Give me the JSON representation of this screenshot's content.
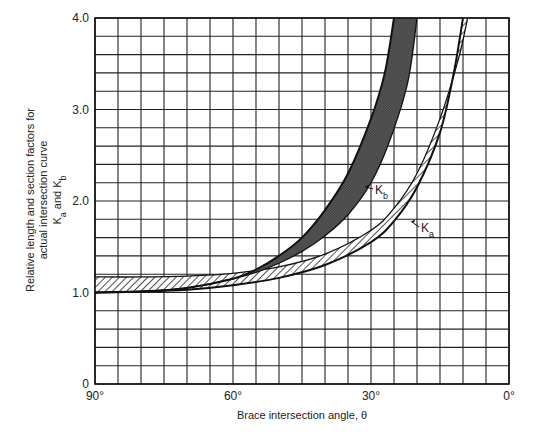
{
  "chart_data": {
    "type": "area",
    "title": "",
    "xlabel": "Brace intersection angle, θ",
    "ylabel_lines": [
      "Relative length and section factors for",
      "actual intersection curve",
      "K_a and K_b"
    ],
    "ylabel": "Relative length and section factors for actual intersection curve K_a and K_b",
    "xlim": [
      90,
      0
    ],
    "ylim": [
      0,
      4.0
    ],
    "x_ticks": [
      {
        "value": 90,
        "label": "90°"
      },
      {
        "value": 60,
        "label": "60°"
      },
      {
        "value": 30,
        "label": "30°"
      },
      {
        "value": 0,
        "label": "0°"
      }
    ],
    "y_ticks": [
      {
        "value": 0,
        "label": "0"
      },
      {
        "value": 1.0,
        "label": "1.0"
      },
      {
        "value": 2.0,
        "label": "2.0"
      },
      {
        "value": 3.0,
        "label": "3.0"
      },
      {
        "value": 4.0,
        "label": "4.0"
      }
    ],
    "grid": {
      "x_step_deg": 5,
      "y_step": 0.2,
      "on": true
    },
    "series": [
      {
        "name": "K_b",
        "label": "K",
        "subscript": "b",
        "fill": "dark-crosshatch",
        "lower": {
          "theta": [
            90,
            80,
            70,
            60,
            55,
            50,
            45,
            40,
            35,
            30,
            27,
            25
          ],
          "K": [
            1.0,
            1.01,
            1.05,
            1.15,
            1.25,
            1.4,
            1.6,
            1.9,
            2.3,
            2.9,
            3.4,
            4.0
          ]
        },
        "upper": {
          "theta": [
            90,
            80,
            70,
            60,
            55,
            50,
            45,
            40,
            35,
            30,
            26,
            22,
            20
          ],
          "K": [
            1.0,
            1.01,
            1.05,
            1.15,
            1.22,
            1.32,
            1.45,
            1.62,
            1.85,
            2.2,
            2.65,
            3.3,
            4.0
          ]
        }
      },
      {
        "name": "K_a",
        "label": "K",
        "subscript": "a",
        "fill": "diagonal-hatch",
        "lower": {
          "theta": [
            90,
            80,
            70,
            60,
            50,
            40,
            30,
            25,
            20,
            15,
            12,
            10
          ],
          "K": [
            1.0,
            1.01,
            1.03,
            1.08,
            1.16,
            1.3,
            1.55,
            1.78,
            2.15,
            2.75,
            3.4,
            4.0
          ]
        },
        "upper": {
          "theta": [
            90,
            80,
            70,
            60,
            50,
            40,
            30,
            25,
            20,
            15,
            11,
            9
          ],
          "K": [
            1.17,
            1.17,
            1.18,
            1.21,
            1.28,
            1.42,
            1.68,
            1.92,
            2.3,
            2.9,
            3.55,
            4.0
          ]
        }
      }
    ],
    "annotations": [
      {
        "text": "K_b",
        "arrow_to": {
          "theta": 31.5,
          "K": 2.15
        }
      },
      {
        "text": "K_a",
        "arrow_to": {
          "theta": 21.5,
          "K": 1.77
        }
      }
    ]
  }
}
